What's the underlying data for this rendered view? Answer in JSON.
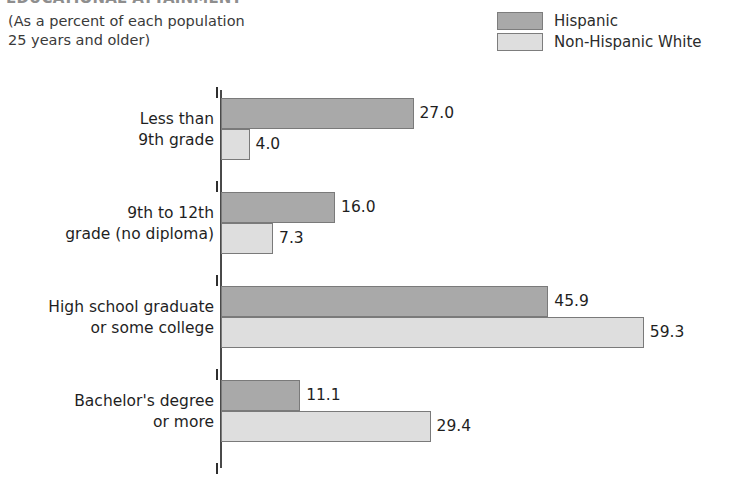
{
  "chart_title": "EDUCATIONAL ATTAINMENT",
  "subtitle": "(As a percent of each population\n25 years and older)",
  "legend": {
    "position": "top-right",
    "entries": [
      {
        "label": "Hispanic",
        "color": "#a9a9a9",
        "swatch_name": "legend-swatch-hispanic"
      },
      {
        "label": "Non-Hispanic White",
        "color": "#dedede",
        "swatch_name": "legend-swatch-non-hispanic-white"
      }
    ]
  },
  "chart_data": {
    "type": "bar",
    "orientation": "horizontal",
    "title": "EDUCATIONAL ATTAINMENT",
    "subtitle": "(As a percent of each population 25 years and older)",
    "xlabel": "",
    "ylabel": "",
    "xlim": [
      0,
      60
    ],
    "grid": false,
    "legend_position": "top-right",
    "categories": [
      "Less than\n9th grade",
      "9th to 12th\ngrade (no diploma)",
      "High school graduate\nor some college",
      "Bachelor's degree\nor more"
    ],
    "series": [
      {
        "name": "Hispanic",
        "color": "#a9a9a9",
        "values": [
          27.0,
          16.0,
          45.9,
          11.1
        ]
      },
      {
        "name": "Non-Hispanic White",
        "color": "#dedede",
        "values": [
          4.0,
          7.3,
          59.3,
          29.4
        ]
      }
    ],
    "value_labels": [
      [
        "27.0",
        "4.0"
      ],
      [
        "16.0",
        "7.3"
      ],
      [
        "45.9",
        "59.3"
      ],
      [
        "11.1",
        "29.4"
      ]
    ]
  }
}
